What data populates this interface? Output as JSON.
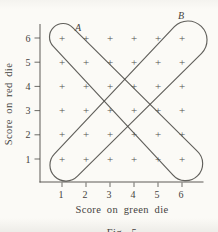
{
  "figure": {
    "event_labels": {
      "a": "A",
      "b": "B"
    },
    "x_axis_title": "Score on green die",
    "y_axis_title": "Score on red die",
    "caption": "Fig. 5",
    "marker_glyph": "+",
    "colors": {
      "ink": "#4b4a45",
      "text": "#45433e",
      "paper": "#fbfaf6"
    }
  },
  "chart_data": {
    "type": "scatter",
    "title": "",
    "xlabel": "Score on green die",
    "ylabel": "Score on red die",
    "xlim": [
      0.5,
      6.9
    ],
    "ylim": [
      0.4,
      6.6
    ],
    "x_ticks": [
      1,
      2,
      3,
      4,
      5,
      6
    ],
    "y_ticks": [
      1,
      2,
      3,
      4,
      5,
      6
    ],
    "marker": "+",
    "points": [
      [
        1,
        1
      ],
      [
        2,
        1
      ],
      [
        3,
        1
      ],
      [
        4,
        1
      ],
      [
        5,
        1
      ],
      [
        6,
        1
      ],
      [
        1,
        2
      ],
      [
        2,
        2
      ],
      [
        3,
        2
      ],
      [
        4,
        2
      ],
      [
        5,
        2
      ],
      [
        6,
        2
      ],
      [
        1,
        3
      ],
      [
        2,
        3
      ],
      [
        3,
        3
      ],
      [
        4,
        3
      ],
      [
        5,
        3
      ],
      [
        6,
        3
      ],
      [
        1,
        4
      ],
      [
        2,
        4
      ],
      [
        3,
        4
      ],
      [
        4,
        4
      ],
      [
        5,
        4
      ],
      [
        6,
        4
      ],
      [
        1,
        5
      ],
      [
        2,
        5
      ],
      [
        3,
        5
      ],
      [
        4,
        5
      ],
      [
        5,
        5
      ],
      [
        6,
        5
      ],
      [
        1,
        6
      ],
      [
        2,
        6
      ],
      [
        3,
        6
      ],
      [
        4,
        6
      ],
      [
        5,
        6
      ],
      [
        6,
        6
      ]
    ],
    "regions": [
      {
        "label": "A",
        "shape": "rounded freehand loop along the anti-diagonal",
        "enclosed_points": [
          [
            1,
            6
          ],
          [
            2,
            5
          ],
          [
            3,
            4
          ],
          [
            4,
            3
          ],
          [
            5,
            2
          ],
          [
            6,
            1
          ]
        ]
      },
      {
        "label": "B",
        "shape": "rounded freehand loop along the main diagonal",
        "enclosed_points": [
          [
            1,
            1
          ],
          [
            2,
            2
          ],
          [
            3,
            3
          ],
          [
            4,
            4
          ],
          [
            5,
            5
          ],
          [
            6,
            6
          ]
        ]
      }
    ],
    "grid": false,
    "legend": false,
    "caption": "Fig. 5"
  }
}
